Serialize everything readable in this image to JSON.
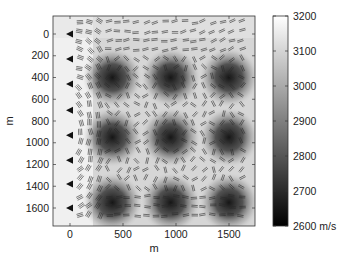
{
  "chart_data": {
    "type": "heatmap",
    "title": "",
    "xlabel": "m",
    "ylabel": "m",
    "x_ticks": [
      0,
      500,
      1000,
      1500
    ],
    "y_ticks": [
      0,
      200,
      400,
      600,
      800,
      1000,
      1200,
      1400,
      1600
    ],
    "xlim": [
      -150,
      1750
    ],
    "ylim": [
      1700,
      -150
    ],
    "y_axis_reversed": true,
    "grid": false,
    "colormap": "gray",
    "colorbar": {
      "ticks": [
        3200,
        3100,
        3000,
        2900,
        2800,
        2700,
        2600
      ],
      "tick_labels": [
        "3200",
        "3100",
        "3000",
        "2900",
        "2800",
        "2700",
        "2600 m/s"
      ],
      "range": [
        2600,
        3200
      ],
      "unit": "m/s",
      "position": "right"
    },
    "field_description": "Background velocity field with periodic low-velocity (dark) anomalies in a 3x3 grid on a high-velocity (light) background",
    "low_velocity_anomalies": [
      {
        "x": 400,
        "y": 400,
        "value": 2650
      },
      {
        "x": 950,
        "y": 400,
        "value": 2650
      },
      {
        "x": 1500,
        "y": 400,
        "value": 2650
      },
      {
        "x": 400,
        "y": 950,
        "value": 2650
      },
      {
        "x": 950,
        "y": 950,
        "value": 2650
      },
      {
        "x": 1500,
        "y": 950,
        "value": 2650
      },
      {
        "x": 400,
        "y": 1550,
        "value": 2650
      },
      {
        "x": 950,
        "y": 1550,
        "value": 2650
      },
      {
        "x": 1500,
        "y": 1550,
        "value": 2650
      }
    ],
    "background_value": 3200,
    "sources": [
      {
        "x": 0,
        "y": 0
      },
      {
        "x": 0,
        "y": 230
      },
      {
        "x": 0,
        "y": 460
      },
      {
        "x": 0,
        "y": 700
      },
      {
        "x": 0,
        "y": 930
      },
      {
        "x": 0,
        "y": 1160
      },
      {
        "x": 0,
        "y": 1380
      },
      {
        "x": 0,
        "y": 1600
      }
    ],
    "overlay": "short line segments (ray/wavefront direction glyphs) distributed across the model"
  },
  "colors": {
    "axis": "#333333",
    "background_light": "#f4f4f4",
    "anomaly_dark": "#1c1c1c",
    "glyph": "#2a2a2a"
  }
}
